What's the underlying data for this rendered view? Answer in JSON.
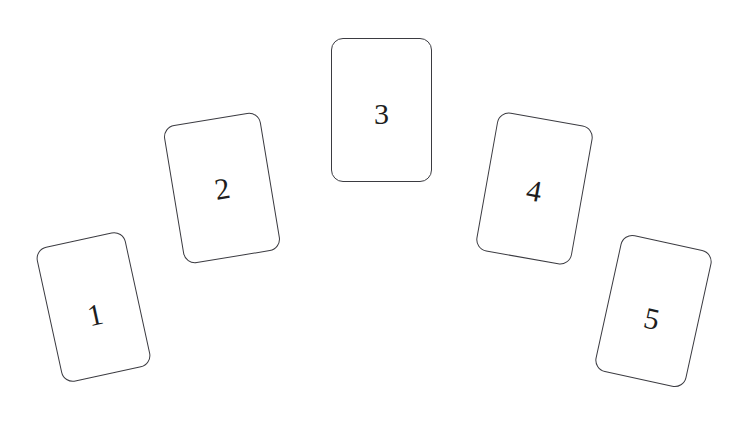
{
  "scene": {
    "title": "Numbered card fan",
    "background_color": "#ffffff",
    "stroke_color": "#3b3b41",
    "label_color": "#1d1d20",
    "width": 742,
    "height": 424
  },
  "cards": [
    {
      "label": "1",
      "name": "card-1",
      "left": 48,
      "top": 238,
      "width": 91,
      "height": 138,
      "rotation": -12.3,
      "label_left_pct": 50,
      "label_top_pct": 56,
      "corner_radius": 12
    },
    {
      "label": "2",
      "name": "card-2",
      "left": 173,
      "top": 118,
      "width": 98,
      "height": 140,
      "rotation": -9.4,
      "label_left_pct": 50,
      "label_top_pct": 51,
      "corner_radius": 12
    },
    {
      "label": "3",
      "name": "card-3",
      "left": 331,
      "top": 38,
      "width": 101,
      "height": 144,
      "rotation": 0,
      "label_left_pct": 50,
      "label_top_pct": 53,
      "corner_radius": 12
    },
    {
      "label": "4",
      "name": "card-4",
      "left": 486,
      "top": 118,
      "width": 97,
      "height": 141,
      "rotation": 10.1,
      "label_left_pct": 50,
      "label_top_pct": 52,
      "corner_radius": 12
    },
    {
      "label": "5",
      "name": "card-5",
      "left": 607,
      "top": 241,
      "width": 93,
      "height": 140,
      "rotation": 12.4,
      "label_left_pct": 50,
      "label_top_pct": 56,
      "corner_radius": 12
    }
  ]
}
